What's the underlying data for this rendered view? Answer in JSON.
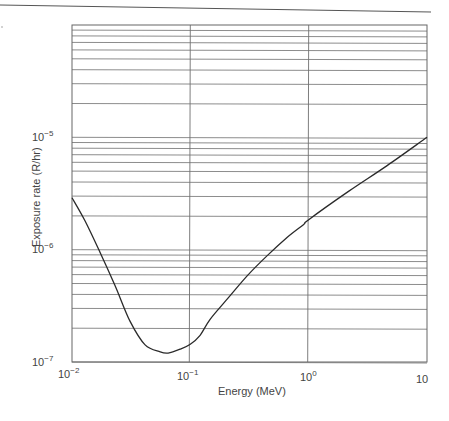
{
  "chart_data": {
    "type": "line",
    "title": "",
    "xlabel": "Energy (MeV)",
    "ylabel": "Exposure rate (R/hr)",
    "xscale": "log",
    "yscale": "log",
    "xlim": [
      0.01,
      10
    ],
    "ylim": [
      1e-07,
      0.0001
    ],
    "grid": {
      "x_major": true,
      "y_minor": true
    },
    "legend": null,
    "x_ticks": [
      {
        "value": 0.01,
        "base": "10",
        "exp": "−2"
      },
      {
        "value": 0.1,
        "base": "10",
        "exp": "−1"
      },
      {
        "value": 1,
        "base": "10",
        "exp": "0"
      },
      {
        "value": 10,
        "base": "10",
        "exp": ""
      }
    ],
    "y_ticks": [
      {
        "value": 1e-07,
        "base": "10",
        "exp": "−7"
      },
      {
        "value": 1e-06,
        "base": "10",
        "exp": "−6"
      },
      {
        "value": 1e-05,
        "base": "10",
        "exp": "−5"
      }
    ],
    "series": [
      {
        "name": "Exposure rate",
        "x": [
          0.01,
          0.0129,
          0.0173,
          0.0231,
          0.031,
          0.0415,
          0.0556,
          0.0649,
          0.082,
          0.1,
          0.121,
          0.147,
          0.208,
          0.305,
          0.449,
          0.66,
          0.908,
          1.0,
          2.17,
          4.6,
          10.0
        ],
        "y": [
          2.9e-06,
          1.8e-06,
          9.4e-07,
          4.8e-07,
          2.3e-07,
          1.42e-07,
          1.23e-07,
          1.2e-07,
          1.3e-07,
          1.44e-07,
          1.73e-07,
          2.4e-07,
          3.7e-07,
          5.9e-07,
          8.9e-07,
          1.29e-06,
          1.68e-06,
          1.85e-06,
          3.3e-06,
          5.6e-06,
          1e-05
        ]
      }
    ]
  },
  "labels": {
    "xlabel": "Energy (MeV)",
    "ylabel": "Exposure rate (R/hr)",
    "x_ticks": [
      {
        "base": "10",
        "exp": "−2"
      },
      {
        "base": "10",
        "exp": "−1"
      },
      {
        "base": "10",
        "exp": "0"
      },
      {
        "base": "10",
        "exp": ""
      }
    ],
    "y_ticks": [
      {
        "base": "10",
        "exp": "−7"
      },
      {
        "base": "10",
        "exp": "−6"
      },
      {
        "base": "10",
        "exp": "−5"
      }
    ]
  },
  "colors": {
    "grid": "#6f6f6f",
    "curve": "#2a2a2a",
    "text": "#444444"
  }
}
